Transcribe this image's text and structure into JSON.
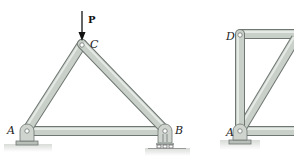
{
  "figure": {
    "left_truss": {
      "joints": [
        {
          "id": "A",
          "label": "A",
          "x": 27,
          "y": 130
        },
        {
          "id": "B",
          "label": "B",
          "x": 165,
          "y": 130
        },
        {
          "id": "C",
          "label": "C",
          "x": 82,
          "y": 44
        }
      ],
      "members": [
        [
          "A",
          "C"
        ],
        [
          "C",
          "B"
        ],
        [
          "A",
          "B"
        ]
      ],
      "load": {
        "label": "P",
        "at": "C",
        "direction": "down"
      },
      "supports": [
        {
          "joint": "A",
          "type": "pin"
        },
        {
          "joint": "B",
          "type": "roller"
        }
      ]
    },
    "right_truss": {
      "joints": [
        {
          "id": "D",
          "label": "D",
          "x": 240,
          "y": 33
        },
        {
          "id": "A",
          "label": "A",
          "x": 240,
          "y": 130
        }
      ],
      "supports": [
        {
          "joint": "A",
          "type": "pin"
        }
      ]
    },
    "colors": {
      "member_fill": "#c9cfc9",
      "member_edge": "#6f7772",
      "ground": "#e4e6e4"
    }
  }
}
